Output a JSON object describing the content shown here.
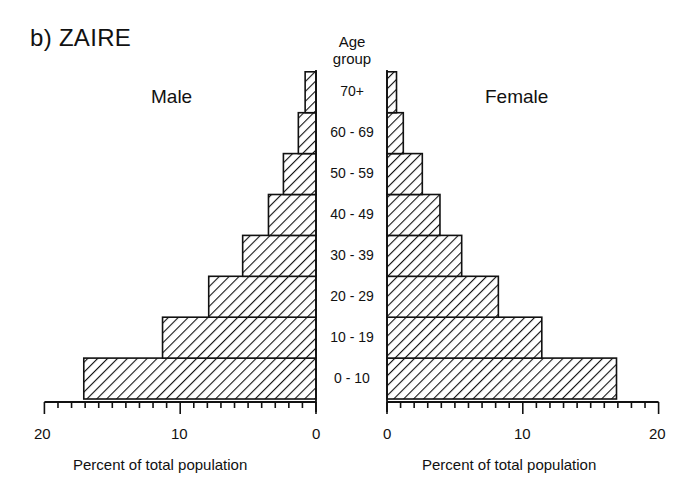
{
  "title": "b) ZAIRE",
  "age_header": [
    "Age",
    "group"
  ],
  "chart_data": {
    "type": "bar",
    "subtype": "population-pyramid",
    "title": "b) ZAIRE",
    "categories": [
      "0 - 10",
      "10 - 19",
      "20 - 29",
      "30 - 39",
      "40 - 49",
      "50 - 59",
      "60 - 69",
      "70+"
    ],
    "series": [
      {
        "name": "Male",
        "values": [
          17.1,
          11.3,
          7.9,
          5.4,
          3.5,
          2.4,
          1.3,
          0.8
        ]
      },
      {
        "name": "Female",
        "values": [
          16.9,
          11.4,
          8.2,
          5.5,
          3.9,
          2.6,
          1.2,
          0.7
        ]
      }
    ],
    "xlabel": "Percent of total population",
    "ylabel": "Age group",
    "xlim": [
      0,
      20
    ],
    "x_ticks": [
      0,
      10,
      20
    ],
    "minor_tick_step": 1,
    "fill": "diagonal hatch",
    "grid": false,
    "legend": "side labels: Male (left), Female (right)"
  },
  "labels": {
    "male": "Male",
    "female": "Female",
    "left_axis_title": "Percent of total population",
    "right_axis_title": "Percent of total population",
    "left_ticks": [
      "20",
      "10",
      "0"
    ],
    "right_ticks": [
      "0",
      "10",
      "20"
    ]
  }
}
